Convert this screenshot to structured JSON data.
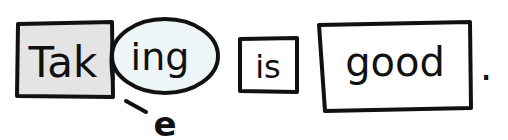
{
  "diagram": {
    "stem": {
      "text": "Tak",
      "fill": "#e4e4e4"
    },
    "suffix": {
      "text": "ing",
      "fill": "#eef5f7"
    },
    "dropped_letter": {
      "text": "e"
    },
    "word2": {
      "text": "is"
    },
    "word3": {
      "text": "good"
    },
    "punctuation": {
      "text": "."
    }
  },
  "colors": {
    "stroke": "#111111",
    "background": "#ffffff"
  }
}
